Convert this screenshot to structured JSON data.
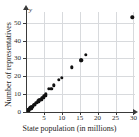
{
  "chart_data": {
    "type": "scatter",
    "title": "",
    "xlabel": "State population (in millions)",
    "ylabel": "Number of representatives",
    "y_axis_variable": "y",
    "xlim": [
      0,
      38
    ],
    "ylim": [
      0,
      56
    ],
    "xticks": [
      5,
      10,
      15,
      20,
      25,
      30
    ],
    "yticks": [
      0,
      10,
      20,
      30,
      40,
      50
    ],
    "xtick_labels": [
      "5",
      "10",
      "15",
      "20",
      "25",
      "30"
    ],
    "ytick_labels": [
      "0",
      "10",
      "20",
      "30",
      "40",
      "50"
    ],
    "grid": true,
    "legend": "none",
    "marker_color": "#111111",
    "grid_color": "#d8dadd",
    "axis_color": "#3a3a3a",
    "background": "#ffffff",
    "points": [
      [
        0.6,
        1
      ],
      [
        0.7,
        1
      ],
      [
        0.8,
        1
      ],
      [
        0.9,
        1
      ],
      [
        1.0,
        1
      ],
      [
        1.3,
        2
      ],
      [
        1.3,
        2
      ],
      [
        1.6,
        2
      ],
      [
        1.8,
        2
      ],
      [
        1.9,
        3
      ],
      [
        2.0,
        3
      ],
      [
        2.4,
        3
      ],
      [
        2.7,
        4
      ],
      [
        2.9,
        4
      ],
      [
        3.0,
        4
      ],
      [
        3.1,
        4
      ],
      [
        3.5,
        5
      ],
      [
        3.8,
        5
      ],
      [
        4.3,
        6
      ],
      [
        4.5,
        6
      ],
      [
        4.7,
        7
      ],
      [
        5.0,
        7
      ],
      [
        5.3,
        7
      ],
      [
        5.6,
        8
      ],
      [
        5.8,
        8
      ],
      [
        6.0,
        8
      ],
      [
        6.3,
        9
      ],
      [
        6.5,
        9
      ],
      [
        6.7,
        9
      ],
      [
        7.0,
        10
      ],
      [
        8.0,
        13
      ],
      [
        8.8,
        13
      ],
      [
        9.7,
        15
      ],
      [
        11.5,
        18
      ],
      [
        12.4,
        19
      ],
      [
        15.9,
        25
      ],
      [
        19.0,
        29
      ],
      [
        19.3,
        29
      ],
      [
        20.8,
        32
      ],
      [
        37.0,
        53
      ]
    ]
  }
}
